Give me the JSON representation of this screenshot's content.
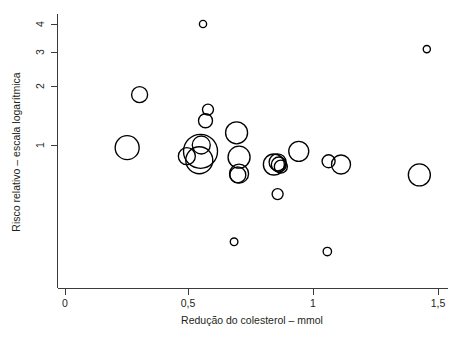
{
  "chart_data": {
    "type": "scatter",
    "title": "",
    "subtitle": "",
    "xlabel": "Redução do colesterol – mmol",
    "ylabel": "Risco relativo – escala logarítmica",
    "xlim": [
      0,
      1.5
    ],
    "ylim_log": [
      0.25,
      4.4
    ],
    "yscale": "log",
    "grid": false,
    "legend": null,
    "xticks": [
      {
        "value": 0,
        "label": "0",
        "px": 65
      },
      {
        "value": 0.5,
        "label": "0,5",
        "px": 188
      },
      {
        "value": 1.0,
        "label": "1",
        "px": 313
      },
      {
        "value": 1.5,
        "label": "1,5",
        "px": 438
      }
    ],
    "yticks": [
      {
        "value": 1,
        "label": "1",
        "px": 145
      },
      {
        "value": 2,
        "label": "2",
        "px": 86
      },
      {
        "value": 3,
        "label": "3",
        "px": 52
      },
      {
        "value": 4,
        "label": "4",
        "px": 24
      }
    ],
    "marker": "open-circle",
    "size_encoding": "study weight (bubble radius)",
    "points": [
      {
        "id": "p01",
        "x": 0.555,
        "y": 4.0,
        "r": 3.6
      },
      {
        "id": "p02",
        "x": 1.455,
        "y": 3.0,
        "r": 3.6
      },
      {
        "id": "p03",
        "x": 0.3,
        "y": 1.78,
        "r": 8.0
      },
      {
        "id": "p04",
        "x": 0.575,
        "y": 1.5,
        "r": 5.5
      },
      {
        "id": "p05",
        "x": 0.565,
        "y": 1.32,
        "r": 7.0
      },
      {
        "id": "p06",
        "x": 0.69,
        "y": 1.15,
        "r": 11.0
      },
      {
        "id": "p07",
        "x": 0.25,
        "y": 0.97,
        "r": 12.0
      },
      {
        "id": "p08",
        "x": 0.548,
        "y": 1.0,
        "r": 9.0
      },
      {
        "id": "p09",
        "x": 0.545,
        "y": 0.93,
        "r": 17.0
      },
      {
        "id": "p10",
        "x": 0.49,
        "y": 0.88,
        "r": 8.5
      },
      {
        "id": "p11",
        "x": 0.54,
        "y": 0.84,
        "r": 13.5
      },
      {
        "id": "p12",
        "x": 0.7,
        "y": 0.87,
        "r": 11.0
      },
      {
        "id": "p13",
        "x": 0.7,
        "y": 0.72,
        "r": 9.5
      },
      {
        "id": "p14",
        "x": 0.695,
        "y": 0.71,
        "r": 8.0
      },
      {
        "id": "p15",
        "x": 0.84,
        "y": 0.8,
        "r": 10.5
      },
      {
        "id": "p16",
        "x": 0.855,
        "y": 0.82,
        "r": 8.5
      },
      {
        "id": "p17",
        "x": 0.86,
        "y": 0.8,
        "r": 7.5
      },
      {
        "id": "p18",
        "x": 0.868,
        "y": 0.78,
        "r": 6.5
      },
      {
        "id": "p19",
        "x": 0.94,
        "y": 0.93,
        "r": 10.0
      },
      {
        "id": "p20",
        "x": 0.855,
        "y": 0.57,
        "r": 5.5
      },
      {
        "id": "p21",
        "x": 1.06,
        "y": 0.83,
        "r": 6.5
      },
      {
        "id": "p22",
        "x": 1.11,
        "y": 0.8,
        "r": 9.5
      },
      {
        "id": "p23",
        "x": 1.425,
        "y": 0.71,
        "r": 11.0
      },
      {
        "id": "p24",
        "x": 0.68,
        "y": 0.33,
        "r": 3.8
      },
      {
        "id": "p25",
        "x": 1.055,
        "y": 0.295,
        "r": 4.2
      }
    ]
  },
  "axes": {
    "x_axis_name": "x-axis",
    "y_axis_name": "y-axis"
  }
}
